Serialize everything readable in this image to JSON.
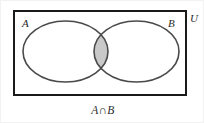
{
  "diagram": {
    "type": "venn-diagram",
    "title": "",
    "caption": "A∩B",
    "universe": {
      "label": "U",
      "label_position": "outside-top-right",
      "shape": "rectangle",
      "border_color": "#1a1a1a",
      "fill_color": "#ffffff",
      "x": 12,
      "y": 9,
      "width": 174,
      "height": 86,
      "stroke_width": 2
    },
    "sets": [
      {
        "id": "A",
        "label": "A",
        "shape": "ellipse",
        "cx": 64.5,
        "cy": 50.5,
        "rx": 42.5,
        "ry": 30.5,
        "stroke_color": "#4a4a4a",
        "fill_color": "#ffffff",
        "stroke_width": 1.6,
        "label_x": 24,
        "label_y": 22
      },
      {
        "id": "B",
        "label": "B",
        "shape": "ellipse",
        "cx": 135.5,
        "cy": 50.5,
        "rx": 42.5,
        "ry": 30.5,
        "stroke_color": "#4a4a4a",
        "fill_color": "#ffffff",
        "stroke_width": 1.6,
        "label_x": 170,
        "label_y": 22
      }
    ],
    "shaded_region": {
      "name": "intersection",
      "notation": "A∩B",
      "fill_color": "#c9c9c9",
      "stroke_color": "#4a4a4a",
      "description": "lens where both ellipses overlap"
    },
    "colors": {
      "background": "#ffffff",
      "rect_border": "#1a1a1a",
      "ellipse_stroke": "#4a4a4a",
      "shade": "#c9c9c9",
      "text": "#2b2b2b"
    }
  }
}
